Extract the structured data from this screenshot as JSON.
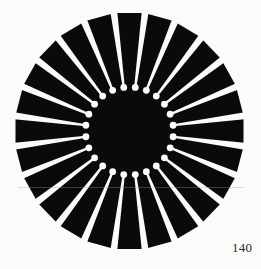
{
  "page": {
    "page_number": "140",
    "background": "#fbfbf9"
  },
  "figure": {
    "type": "radial-sunburst",
    "spoke_count": 24,
    "spoke_angle_offset_deg": 7.5,
    "center": [
      129.5,
      131
    ],
    "outer_radius_x": 115,
    "outer_radius_y": 119,
    "inner_disk_radius": 40,
    "dot_ring_radius": 44,
    "dot_radius": 3.4,
    "spoke_inner_width": 2.2,
    "spoke_outer_width": 7,
    "fill_color": "#0a0a0a",
    "spoke_color": "#fbfbf9"
  }
}
